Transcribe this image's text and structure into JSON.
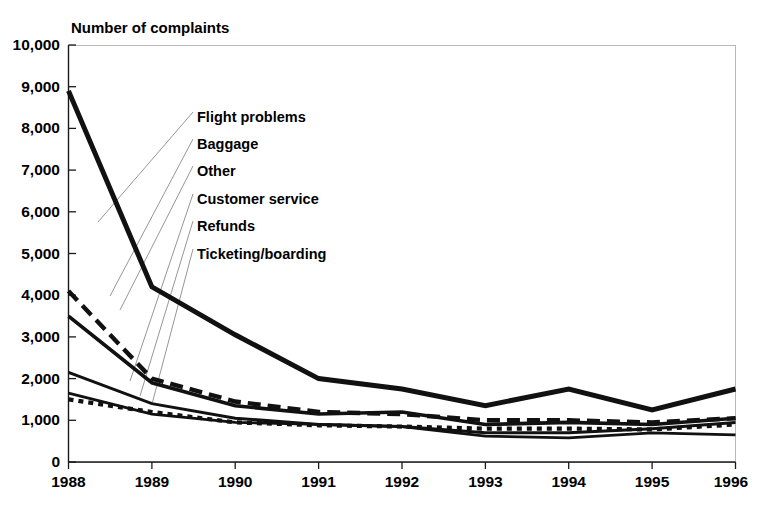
{
  "chart_data": {
    "type": "line",
    "title": "Number of complaints",
    "xlabel": "",
    "ylabel": "Number of complaints",
    "x": [
      1988,
      1989,
      1990,
      1991,
      1992,
      1993,
      1994,
      1995,
      1996
    ],
    "xticklabels": [
      "1988",
      "1989",
      "1990",
      "1991",
      "1992",
      "1993",
      "1994",
      "1995",
      "1996"
    ],
    "yticklabels": [
      "0",
      "1,000",
      "2,000",
      "3,000",
      "4,000",
      "5,000",
      "6,000",
      "7,000",
      "8,000",
      "9,000",
      "10,000"
    ],
    "ytickvalues": [
      0,
      1000,
      2000,
      3000,
      4000,
      5000,
      6000,
      7000,
      8000,
      9000,
      10000
    ],
    "ylim": [
      0,
      10000
    ],
    "xlim": [
      1988,
      1996
    ],
    "grid": false,
    "legend_position": "inside-upper-left",
    "series": [
      {
        "name": "Flight problems",
        "style": "solid-thick",
        "values": [
          8900,
          4200,
          3050,
          2000,
          1750,
          1350,
          1750,
          1250,
          1750
        ]
      },
      {
        "name": "Baggage",
        "style": "dashed-thick",
        "values": [
          4100,
          2000,
          1450,
          1200,
          1150,
          1000,
          1000,
          950,
          1050
        ]
      },
      {
        "name": "Other",
        "style": "solid-medium",
        "values": [
          3500,
          1900,
          1350,
          1150,
          1200,
          900,
          950,
          900,
          1050
        ]
      },
      {
        "name": "Customer service",
        "style": "solid-thin",
        "values": [
          2150,
          1400,
          1050,
          900,
          850,
          700,
          700,
          800,
          950
        ]
      },
      {
        "name": "Refunds",
        "style": "solid-thin2",
        "values": [
          1650,
          1150,
          950,
          900,
          850,
          620,
          580,
          700,
          650
        ]
      },
      {
        "name": "Ticketing/boarding",
        "style": "dotted",
        "values": [
          1500,
          1200,
          950,
          880,
          850,
          800,
          800,
          780,
          900
        ]
      }
    ]
  },
  "axis_title": {
    "text": "Number of complaints"
  },
  "legend": {
    "entries": [
      {
        "label": "Flight problems"
      },
      {
        "label": "Baggage"
      },
      {
        "label": "Other"
      },
      {
        "label": "Customer service"
      },
      {
        "label": "Refunds"
      },
      {
        "label": "Ticketing/boarding"
      }
    ]
  },
  "colors": {
    "ink": "#111111",
    "frame": "#b9b9b9",
    "leader": "#8a8a8a",
    "background": "#ffffff"
  }
}
